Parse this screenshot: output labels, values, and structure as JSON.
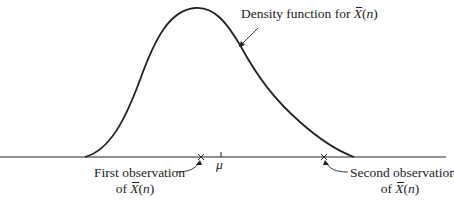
{
  "diagram": {
    "type": "density-curve-illustration",
    "curve_label": {
      "prefix": "Density function for ",
      "var": "X",
      "suffix_open": "(",
      "arg": "n",
      "suffix_close": ")"
    },
    "axis_marker": {
      "symbol": "μ"
    },
    "first_observation": {
      "line1": "First observation",
      "line2_prefix": "of ",
      "var": "X",
      "arg": "n"
    },
    "second_observation": {
      "line1": "Second observation",
      "line2_prefix": "of ",
      "var": "X",
      "arg": "n"
    },
    "marker_glyph": "×",
    "colors": {
      "ink": "#222222",
      "background": "#ffffff"
    }
  }
}
